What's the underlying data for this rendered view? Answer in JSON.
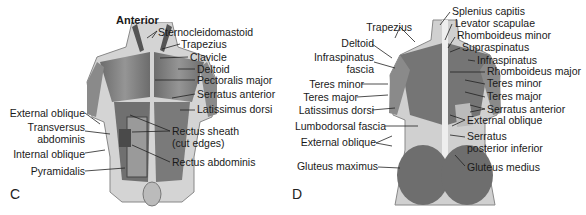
{
  "panels": [
    {
      "letter": "C",
      "title": "Anterior",
      "labels_right": [
        "Sternocleidomastoid",
        "Trapezius",
        "Clavicle",
        "Deltoid",
        "Pectoralis major",
        "Serratus anterior",
        "Latissimus dorsi",
        "Rectus sheath",
        "(cut edges)",
        "Rectus abdominis"
      ],
      "labels_left": [
        "External oblique",
        "Transversus",
        "abdominis",
        "Internal oblique",
        "Pyramidalis"
      ]
    },
    {
      "letter": "D",
      "title": "",
      "labels_right": [
        "Splenius capitis",
        "Levator scapulae",
        "Rhomboideus minor",
        "Supraspinatus",
        "Infraspinatus",
        "Rhomboideus major",
        "Teres minor",
        "Teres major",
        "Serratus anterior",
        "External oblique",
        "Serratus",
        "posterior inferior",
        "Gluteus medius"
      ],
      "labels_left": [
        "Trapezius",
        "Deltoid",
        "Infraspinatus",
        "fascia",
        "Teres minor",
        "Teres major",
        "Latissimus dorsi",
        "Lumbodorsal fascia",
        "External oblique",
        "Gluteus maximus"
      ]
    }
  ],
  "colors": {
    "muscle": "#6e6e6e",
    "muscle_dark": "#4a4a4a",
    "skin": "#d9d9d9",
    "line": "#222222"
  }
}
